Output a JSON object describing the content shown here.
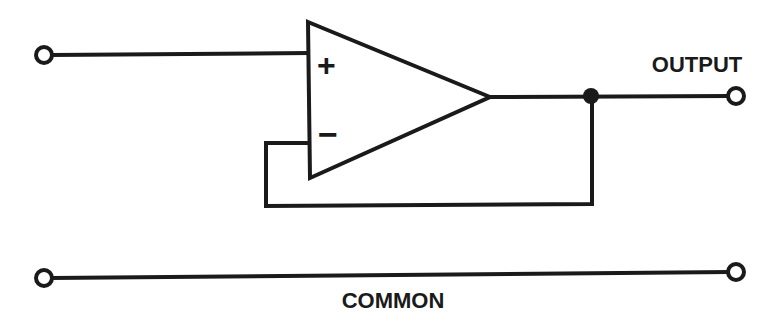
{
  "diagram": {
    "type": "circuit-schematic",
    "labels": {
      "output": "OUTPUT",
      "common": "COMMON",
      "non_inverting": "+",
      "inverting": "−"
    },
    "components": [
      {
        "id": "op-amp",
        "kind": "operational-amplifier"
      },
      {
        "id": "input-terminal",
        "kind": "terminal"
      },
      {
        "id": "output-terminal",
        "kind": "terminal"
      },
      {
        "id": "common-left-terminal",
        "kind": "terminal"
      },
      {
        "id": "common-right-terminal",
        "kind": "terminal"
      },
      {
        "id": "output-junction",
        "kind": "junction"
      }
    ],
    "connections": [
      {
        "from": "input-terminal",
        "to": "op-amp.non_inverting"
      },
      {
        "from": "op-amp.output",
        "to": "output-junction"
      },
      {
        "from": "output-junction",
        "to": "output-terminal"
      },
      {
        "from": "output-junction",
        "to": "op-amp.inverting",
        "note": "feedback loop"
      },
      {
        "from": "common-left-terminal",
        "to": "common-right-terminal"
      }
    ],
    "colors": {
      "ink": "#1a1a1a",
      "background": "#ffffff"
    }
  }
}
